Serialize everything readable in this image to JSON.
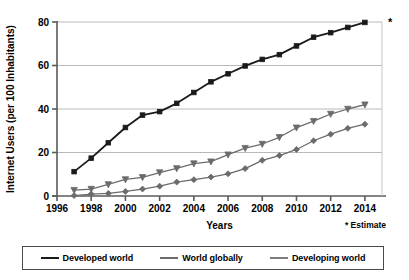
{
  "chart_data": {
    "type": "line",
    "title": "",
    "xlabel": "Years",
    "ylabel": "Internet Users (per 100 Inhabitants)",
    "xlim": [
      1996,
      2015
    ],
    "ylim": [
      0,
      80
    ],
    "yticks": [
      0,
      20,
      40,
      60,
      80
    ],
    "xticks": [
      1996,
      1998,
      2000,
      2002,
      2004,
      2006,
      2008,
      2010,
      2012,
      2014
    ],
    "grid": true,
    "legend_position": "bottom",
    "x": [
      1997,
      1998,
      1999,
      2000,
      2001,
      2002,
      2003,
      2004,
      2005,
      2006,
      2007,
      2008,
      2009,
      2010,
      2011,
      2012,
      2013,
      2014
    ],
    "series": [
      {
        "name": "Developed world",
        "color": "#1a1a1a",
        "marker": "square",
        "values": [
          11.2,
          17.4,
          24.5,
          31.5,
          37.2,
          38.8,
          42.6,
          47.6,
          52.5,
          56.2,
          59.8,
          62.8,
          65.0,
          69.0,
          73.0,
          75.1,
          77.5,
          79.8
        ]
      },
      {
        "name": "World globally",
        "color": "#6b6b6b",
        "marker": "triangle-down",
        "values": [
          2.7,
          3.2,
          5.3,
          7.6,
          8.6,
          10.8,
          12.7,
          14.9,
          15.8,
          19.0,
          22.0,
          23.9,
          27.0,
          31.4,
          34.4,
          37.7,
          40.0,
          42.0
        ]
      },
      {
        "name": "Developing world",
        "color": "#6b6b6b",
        "marker": "diamond",
        "values": [
          0.2,
          0.9,
          1.2,
          2.1,
          3.2,
          4.5,
          6.4,
          7.5,
          8.7,
          10.2,
          12.6,
          16.4,
          18.6,
          21.4,
          25.4,
          28.4,
          31.1,
          33.0
        ]
      }
    ],
    "annotations": [
      {
        "name": "estimate-note",
        "text": "* Estimate"
      },
      {
        "name": "estimate-asterisk",
        "text": "*"
      }
    ]
  },
  "legend": {
    "items": [
      {
        "label": "Developed world",
        "color": "#1a1a1a"
      },
      {
        "label": "World globally",
        "color": "#6b6b6b"
      },
      {
        "label": "Developing world",
        "color": "#7d7d7d"
      }
    ]
  }
}
